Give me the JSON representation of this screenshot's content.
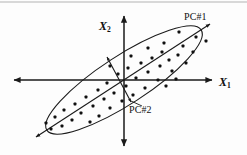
{
  "figure": {
    "kind": "pca-principal-component-diagram",
    "background_color": "#fdfdfd",
    "stroke_color": "#1a1a1a",
    "point_color": "#101010"
  },
  "labels": {
    "x_axis": "X",
    "x_axis_sub": "1",
    "y_axis": "X",
    "y_axis_sub": "2",
    "pc1": "PC#1",
    "pc2": "PC#2"
  },
  "chart_data": {
    "type": "scatter",
    "title": "",
    "xlabel": "X1",
    "ylabel": "X2",
    "grid": false,
    "legend": null,
    "origin_px": [
      124,
      80
    ],
    "axes_px": {
      "x_left": 14,
      "x_right": 212,
      "y_top": 16,
      "y_bottom": 146
    },
    "ellipse_px": {
      "center": [
        124,
        80
      ],
      "semi_major": 92,
      "semi_minor": 24,
      "rotation_deg": -33
    },
    "annotations": [
      {
        "name": "pc1",
        "text": "PC#1",
        "kind": "double-arrow-axis",
        "from_px": [
          36,
          137
        ],
        "to_px": [
          212,
          23
        ]
      },
      {
        "name": "pc2",
        "text": "PC#2",
        "kind": "double-arrow-axis",
        "from_px": [
          107,
          57
        ],
        "to_px": [
          131,
          102
        ]
      },
      {
        "name": "pc2-leader",
        "kind": "leader-line",
        "from_px": [
          131,
          102
        ],
        "to_px": [
          143,
          107
        ]
      }
    ],
    "points_px": [
      [
        179,
        32
      ],
      [
        196,
        37
      ],
      [
        206,
        41
      ],
      [
        164,
        43
      ],
      [
        183,
        46
      ],
      [
        162,
        52
      ],
      [
        148,
        48
      ],
      [
        178,
        55
      ],
      [
        193,
        52
      ],
      [
        131,
        56
      ],
      [
        152,
        58
      ],
      [
        169,
        60
      ],
      [
        141,
        63
      ],
      [
        160,
        66
      ],
      [
        186,
        63
      ],
      [
        110,
        66
      ],
      [
        128,
        68
      ],
      [
        148,
        72
      ],
      [
        172,
        71
      ],
      [
        118,
        74
      ],
      [
        136,
        78
      ],
      [
        158,
        80
      ],
      [
        176,
        79
      ],
      [
        107,
        83
      ],
      [
        126,
        86
      ],
      [
        145,
        88
      ],
      [
        166,
        86
      ],
      [
        98,
        90
      ],
      [
        114,
        93
      ],
      [
        133,
        95
      ],
      [
        86,
        97
      ],
      [
        104,
        99
      ],
      [
        122,
        101
      ],
      [
        75,
        104
      ],
      [
        93,
        106
      ],
      [
        110,
        108
      ],
      [
        64,
        110
      ],
      [
        81,
        113
      ],
      [
        99,
        116
      ],
      [
        55,
        117
      ],
      [
        72,
        120
      ],
      [
        90,
        122
      ],
      [
        46,
        123
      ],
      [
        62,
        126
      ],
      [
        51,
        129
      ]
    ]
  }
}
